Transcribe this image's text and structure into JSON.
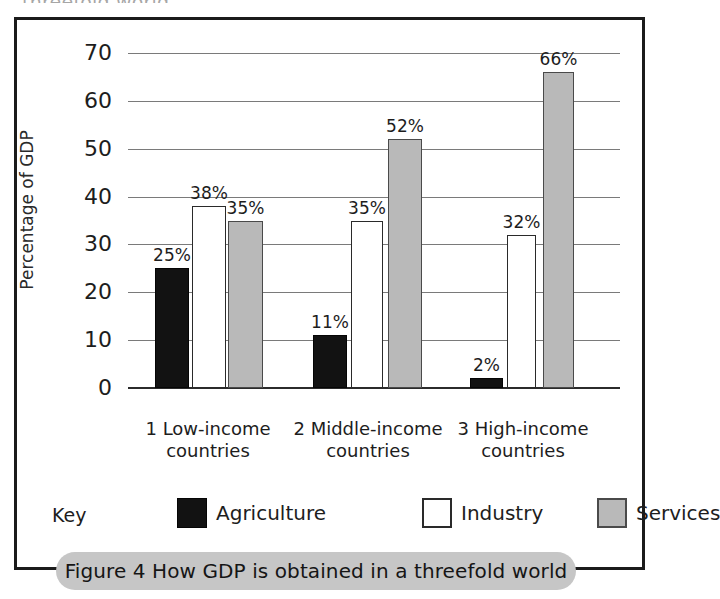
{
  "bleed_text": "threefold world.",
  "caption": "Figure 4 How GDP is obtained in a threefold world",
  "legend": {
    "title": "Key",
    "items": [
      {
        "label": "Agriculture",
        "key": "agriculture",
        "color": "#121212"
      },
      {
        "label": "Industry",
        "key": "industry",
        "color": "#ffffff"
      },
      {
        "label": "Services",
        "key": "services",
        "color": "#b9b9b9"
      }
    ]
  },
  "chart_data": {
    "type": "bar",
    "title": "Figure 4 How GDP is obtained in a threefold world",
    "xlabel": "",
    "ylabel": "Percentage of GDP",
    "ylim": [
      0,
      70
    ],
    "yticks": [
      0,
      10,
      20,
      30,
      40,
      50,
      60,
      70
    ],
    "ytick_labels": [
      "0",
      "10",
      "20",
      "30",
      "40",
      "50",
      "60",
      "70"
    ],
    "grid": true,
    "legend_position": "bottom",
    "categories": [
      "1 Low-income\ncountries",
      "2 Middle-income\ncountries",
      "3 High-income\ncountries"
    ],
    "series": [
      {
        "name": "Agriculture",
        "values": [
          25,
          11,
          2
        ],
        "labels": [
          "25%",
          "11%",
          "2%"
        ],
        "color": "#121212"
      },
      {
        "name": "Industry",
        "values": [
          38,
          35,
          32
        ],
        "labels": [
          "38%",
          "35%",
          "32%"
        ],
        "color": "#ffffff"
      },
      {
        "name": "Services",
        "values": [
          35,
          52,
          66
        ],
        "labels": [
          "35%",
          "52%",
          "66%"
        ],
        "color": "#b9b9b9"
      }
    ]
  }
}
